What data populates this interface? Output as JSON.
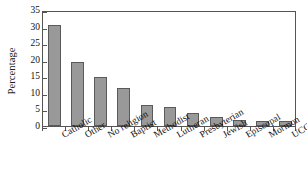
{
  "chart_data": {
    "type": "bar",
    "title": "",
    "xlabel": "",
    "ylabel": "Percentage",
    "categories": [
      "Catholic",
      "Other",
      "No religion",
      "Baptist",
      "Methodist",
      "Lutheran",
      "Presbyterian",
      "Jewish",
      "Episcopal",
      "Mormon",
      "UCC"
    ],
    "values": [
      30.4,
      19.3,
      14.8,
      11.6,
      6.4,
      5.7,
      3.9,
      2.7,
      1.7,
      1.4,
      1.4
    ],
    "ylim": [
      0,
      35
    ],
    "ytick_labels": [
      "0",
      "5",
      "10",
      "15",
      "20",
      "25",
      "30",
      "35"
    ],
    "ytick_values": [
      0,
      5,
      10,
      15,
      20,
      25,
      30,
      35
    ],
    "grid": false,
    "legend": null,
    "bar_color": "#999999",
    "bar_edge_color": "#5a5a5a",
    "axis_color": "#555555",
    "background_color": "#ffffff"
  }
}
